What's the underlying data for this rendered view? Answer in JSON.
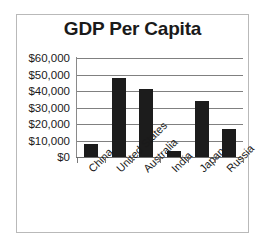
{
  "chart_data": {
    "type": "bar",
    "title": "GDP Per Capita",
    "xlabel": "",
    "ylabel": "",
    "categories": [
      "China",
      "United States",
      "Australia",
      "India",
      "Japan",
      "Russia"
    ],
    "values": [
      8000,
      48000,
      41000,
      3800,
      34000,
      17000
    ],
    "ylim": [
      0,
      60000
    ],
    "ytick_values": [
      0,
      10000,
      20000,
      30000,
      40000,
      50000,
      60000
    ],
    "ytick_labels": [
      "$0",
      "$10,000",
      "$20,000",
      "$30,000",
      "$40,000",
      "$50,000",
      "$60,000"
    ],
    "grid": true,
    "legend": null,
    "bar_color": "#1c1c1c",
    "gridline_color": "#808080",
    "axis_color": "#7a7a7a",
    "frame_color": "#b9b9b9",
    "title_color": "#1a1a1a"
  }
}
